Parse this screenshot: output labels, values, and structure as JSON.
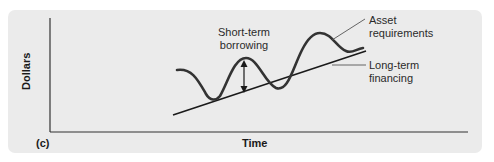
{
  "figure": {
    "panel_label": "(c)",
    "x_axis_label": "Time",
    "y_axis_label": "Dollars",
    "annotations": {
      "short_term": [
        "Short-term",
        "borrowing"
      ],
      "asset": [
        "Asset",
        "requirements"
      ],
      "long_term": [
        "Long-term",
        "financing"
      ]
    },
    "colors": {
      "panel_background": "#ebebeb",
      "line": "#1a1a1a",
      "curve": "#333333",
      "leader": "#555555"
    }
  }
}
